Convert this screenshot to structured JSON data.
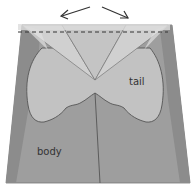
{
  "labels": {
    "tail": "tail",
    "body": "body"
  },
  "colors": {
    "background": "#ffffff",
    "body_fill": "#9e9e9e",
    "body_dark_edge": "#8a8a8a",
    "tail_fill": "#c2c2c2",
    "fold_light": "#d3d3d3",
    "fold_mid": "#c8c8c8",
    "top_band": "#dcdcdc",
    "line": "#555555",
    "dashed": "#333333",
    "arrow": "#333333"
  },
  "annotations": {
    "dashed_fold_line": "fold line",
    "arrows": "open outward"
  }
}
